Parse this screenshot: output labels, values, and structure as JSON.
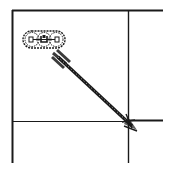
{
  "diagram": {
    "colors": {
      "background": "#ffffff",
      "line": "#1a1a1a",
      "thin_line": "#333333"
    },
    "icons": {
      "chain": "chain-link-icon",
      "arrow": "diagonal-arrow-icon"
    }
  }
}
